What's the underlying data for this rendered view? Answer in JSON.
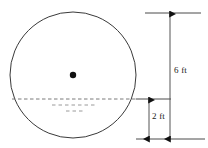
{
  "figure": {
    "background_color": "#ffffff",
    "stroke_color": "#3a3a3a",
    "text_color": "#1a1a1a"
  },
  "circle": {
    "name": "tank-cross-section",
    "center_x": 73,
    "center_y": 75,
    "radius": 63,
    "stroke_width": 1,
    "fill": "none"
  },
  "center_dot": {
    "name": "center-point",
    "x": 73,
    "y": 75,
    "radius": 3.2,
    "color": "#111111"
  },
  "water_line": {
    "name": "water-surface-line",
    "style": "dashed",
    "y": 99,
    "x_start": 12,
    "x_end": 136,
    "color": "#7a7a7a"
  },
  "water_marks": [
    {
      "name": "water-ripple-mark-1",
      "y": 105,
      "x_start": 52,
      "x_end": 96
    },
    {
      "name": "water-ripple-mark-2",
      "y": 111,
      "x_start": 66,
      "x_end": 83
    }
  ],
  "dimensions": [
    {
      "id": "six-ft",
      "label": "6 ft",
      "value": 6,
      "unit": "ft",
      "arrow_x": 170,
      "top_y": 14,
      "bottom_y": 139,
      "tick_top": {
        "x_start": 145,
        "x_end": 201,
        "y": 13
      },
      "tick_bottom": {
        "x_start": 136,
        "x_end": 205,
        "y": 139
      },
      "label_x": 174,
      "label_y": 66
    },
    {
      "id": "two-ft",
      "label": "2 ft",
      "value": 2,
      "unit": "ft",
      "arrow_x": 149,
      "top_y": 100,
      "bottom_y": 139,
      "tick_top": {
        "x_start": 136,
        "x_end": 171,
        "y": 99
      },
      "tick_bottom": {
        "x_start": 136,
        "x_end": 205,
        "y": 139
      },
      "label_x": 152,
      "label_y": 112
    }
  ]
}
